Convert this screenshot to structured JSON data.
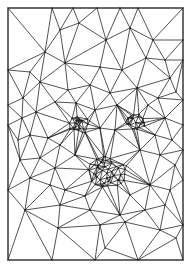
{
  "figure": {
    "width": 191,
    "height": 268,
    "frame": {
      "x0": 8,
      "y0": 8,
      "x1": 183,
      "y1": 260
    },
    "stroke_color": "#1a1a1a",
    "background_color": "#ffffff",
    "dense_regions": [
      {
        "name": "left-eye",
        "cx": 80,
        "cy": 125,
        "r": 9,
        "count": 34
      },
      {
        "name": "right-eye",
        "cx": 136,
        "cy": 122,
        "r": 8,
        "count": 30
      },
      {
        "name": "nose-mouth",
        "cx": 108,
        "cy": 172,
        "r": 16,
        "count": 60
      }
    ],
    "points": [
      [
        8,
        8
      ],
      [
        52,
        8
      ],
      [
        73,
        8
      ],
      [
        97,
        8
      ],
      [
        120,
        8
      ],
      [
        138,
        8
      ],
      [
        183,
        8
      ],
      [
        8,
        70
      ],
      [
        8,
        105
      ],
      [
        8,
        125
      ],
      [
        8,
        190
      ],
      [
        8,
        260
      ],
      [
        183,
        40
      ],
      [
        183,
        60
      ],
      [
        183,
        100
      ],
      [
        183,
        125
      ],
      [
        183,
        150
      ],
      [
        183,
        180
      ],
      [
        183,
        225
      ],
      [
        183,
        260
      ],
      [
        52,
        260
      ],
      [
        95,
        260
      ],
      [
        138,
        260
      ],
      [
        60,
        30
      ],
      [
        79,
        23
      ],
      [
        106,
        40
      ],
      [
        130,
        28
      ],
      [
        153,
        40
      ],
      [
        45,
        52
      ],
      [
        30,
        72
      ],
      [
        65,
        63
      ],
      [
        100,
        67
      ],
      [
        122,
        70
      ],
      [
        146,
        58
      ],
      [
        165,
        60
      ],
      [
        23,
        98
      ],
      [
        40,
        82
      ],
      [
        68,
        90
      ],
      [
        90,
        85
      ],
      [
        110,
        93
      ],
      [
        137,
        88
      ],
      [
        148,
        105
      ],
      [
        170,
        78
      ],
      [
        176,
        92
      ],
      [
        22,
        118
      ],
      [
        36,
        112
      ],
      [
        55,
        102
      ],
      [
        76,
        103
      ],
      [
        95,
        110
      ],
      [
        117,
        105
      ],
      [
        158,
        98
      ],
      [
        165,
        118
      ],
      [
        18,
        140
      ],
      [
        30,
        135
      ],
      [
        48,
        138
      ],
      [
        60,
        145
      ],
      [
        100,
        128
      ],
      [
        115,
        130
      ],
      [
        155,
        135
      ],
      [
        172,
        140
      ],
      [
        20,
        160
      ],
      [
        40,
        158
      ],
      [
        55,
        168
      ],
      [
        75,
        155
      ],
      [
        140,
        150
      ],
      [
        160,
        155
      ],
      [
        175,
        165
      ],
      [
        30,
        178
      ],
      [
        50,
        185
      ],
      [
        65,
        190
      ],
      [
        85,
        196
      ],
      [
        130,
        195
      ],
      [
        150,
        185
      ],
      [
        170,
        190
      ],
      [
        25,
        210
      ],
      [
        60,
        205
      ],
      [
        90,
        210
      ],
      [
        120,
        215
      ],
      [
        145,
        210
      ],
      [
        165,
        205
      ],
      [
        58,
        228
      ],
      [
        100,
        225
      ],
      [
        125,
        222
      ],
      [
        160,
        230
      ],
      [
        105,
        248
      ],
      [
        176,
        238
      ]
    ]
  }
}
